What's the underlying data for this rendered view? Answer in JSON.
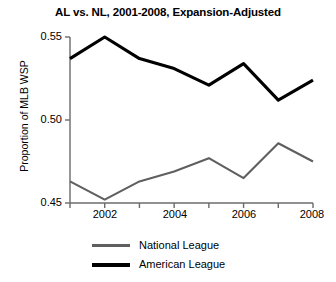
{
  "chart_data": {
    "type": "line",
    "title": "AL vs. NL, 2001-2008, Expansion-Adjusted",
    "xlabel": "",
    "ylabel": "Proportion of MLB WSP",
    "x": [
      2001,
      2002,
      2003,
      2004,
      2005,
      2006,
      2007,
      2008
    ],
    "xlim": [
      2001,
      2008
    ],
    "ylim": [
      0.45,
      0.55
    ],
    "xticks": [
      2002,
      2004,
      2006,
      2008
    ],
    "xtick_labels": [
      "2002",
      "2004",
      "2006",
      "2008"
    ],
    "yticks": [
      0.45,
      0.5,
      0.55
    ],
    "ytick_labels": [
      "0.45",
      "0.50",
      "0.55"
    ],
    "grid": false,
    "legend_position": "bottom",
    "series": [
      {
        "name": "National League",
        "color": "#5f5f5f",
        "values": [
          0.463,
          0.452,
          0.463,
          0.469,
          0.477,
          0.465,
          0.486,
          0.475
        ]
      },
      {
        "name": "American League",
        "color": "#000000",
        "values": [
          0.537,
          0.55,
          0.537,
          0.531,
          0.521,
          0.534,
          0.512,
          0.524
        ]
      }
    ]
  },
  "legend": {
    "items": [
      {
        "label": "National League",
        "swatch": "nl"
      },
      {
        "label": "American League",
        "swatch": "al"
      }
    ]
  }
}
